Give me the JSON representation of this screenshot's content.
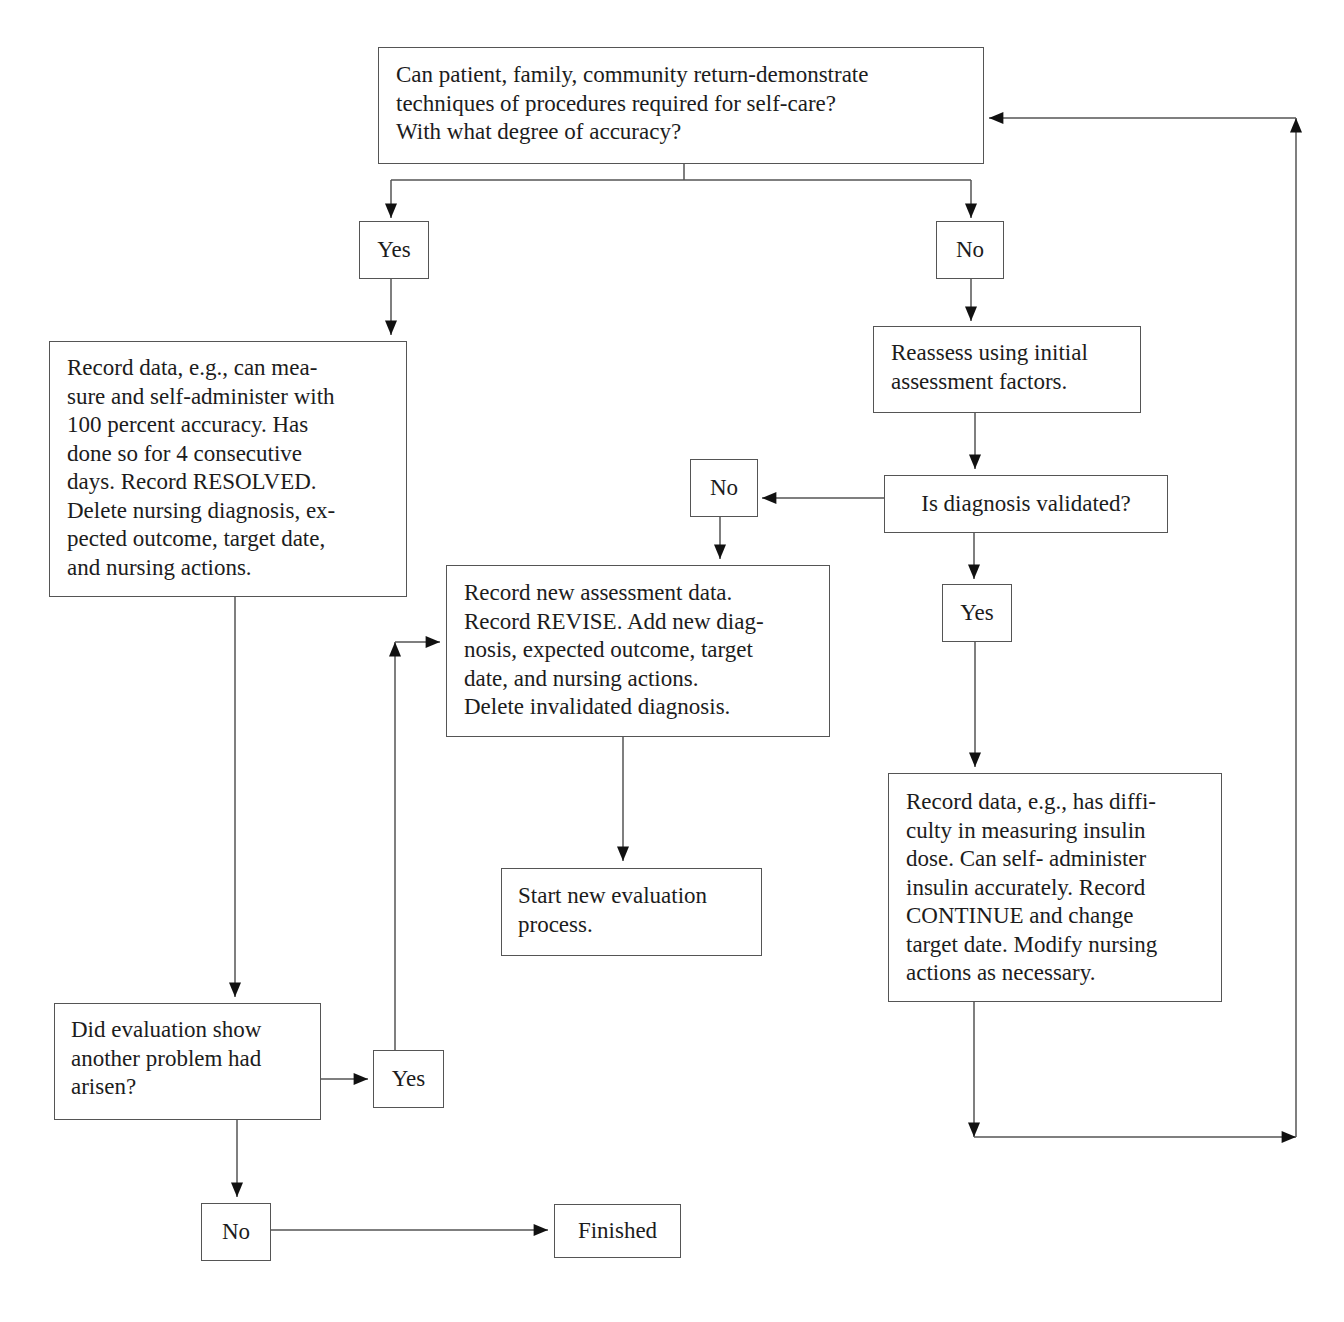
{
  "diagram": {
    "type": "flowchart",
    "nodes": {
      "start_question": "Can patient, family, community return-demonstrate\ntechniques of procedures required for self-care?\nWith what degree of accuracy?",
      "yes_1": "Yes",
      "no_1": "No",
      "resolved_record": "Record data, e.g., can mea-\nsure and self-administer with\n100 percent accuracy. Has\ndone so for 4 consecutive\ndays. Record RESOLVED.\nDelete nursing diagnosis, ex-\npected outcome, target date,\nand nursing actions.",
      "reassess": "Reassess using initial\nassessment factors.",
      "diagnosis_validated": "Is diagnosis validated?",
      "no_2": "No",
      "yes_2": "Yes",
      "revise_record": "Record new assessment data.\nRecord REVISE. Add new diag-\nnosis, expected outcome, target\ndate, and nursing actions.\nDelete invalidated diagnosis.",
      "new_evaluation": "Start new evaluation\nprocess.",
      "continue_record": "Record data, e.g., has diffi-\nculty in measuring insulin\ndose. Can self- administer\ninsulin accurately. Record\nCONTINUE and change\ntarget date. Modify nursing\nactions as necessary.",
      "another_problem": "Did evaluation show\nanother problem had\narisen?",
      "yes_3": "Yes",
      "no_3": "No",
      "finished": "Finished"
    },
    "edges": [
      [
        "start_question",
        "yes_1"
      ],
      [
        "start_question",
        "no_1"
      ],
      [
        "yes_1",
        "resolved_record"
      ],
      [
        "no_1",
        "reassess"
      ],
      [
        "reassess",
        "diagnosis_validated"
      ],
      [
        "diagnosis_validated",
        "no_2"
      ],
      [
        "diagnosis_validated",
        "yes_2"
      ],
      [
        "no_2",
        "revise_record"
      ],
      [
        "revise_record",
        "new_evaluation"
      ],
      [
        "yes_2",
        "continue_record"
      ],
      [
        "continue_record",
        "start_question"
      ],
      [
        "resolved_record",
        "another_problem"
      ],
      [
        "another_problem",
        "yes_3"
      ],
      [
        "yes_3",
        "revise_record"
      ],
      [
        "another_problem",
        "no_3"
      ],
      [
        "no_3",
        "finished"
      ]
    ],
    "colors": {
      "line": "#555555",
      "text": "#1c1c1c",
      "background": "#ffffff"
    }
  }
}
